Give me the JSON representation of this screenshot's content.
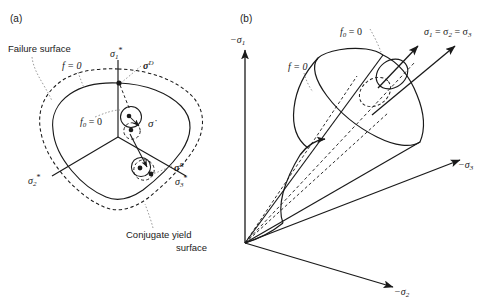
{
  "figure": {
    "background_color": "#ffffff",
    "line_color": "#1a1a1a"
  },
  "panel_a": {
    "tag": "(a)",
    "title_failure": "Failure surface",
    "title_conjugate_line1": "Conjugate yield",
    "title_conjugate_line2": "surface",
    "labels": {
      "f_zero": "f = 0",
      "f0_zero": "f",
      "f0_sub": "0",
      "f0_eq": " = 0",
      "sigma_dot": "σ̇",
      "sigma_D": "σ",
      "sigma_D_sup": "D",
      "sigma_R": "σ",
      "sigma_R_sup": "R",
      "axis1": "σ",
      "axis1_sub": "1",
      "axis1_star": "*",
      "axis2": "σ",
      "axis2_sub": "2",
      "axis2_star": "*",
      "axis3": "σ",
      "axis3_sub": "3",
      "axis3_star": "*"
    }
  },
  "panel_b": {
    "tag": "(b)",
    "labels": {
      "f_zero": "f = 0",
      "f0_zero": "f",
      "f0_sub": "0",
      "f0_eq": " = 0",
      "hydrostatic": "σ",
      "hydrostatic_sub1": "1",
      "hydrostatic_eq1": " = σ",
      "hydrostatic_sub2": "2",
      "hydrostatic_eq2": " = σ",
      "hydrostatic_sub3": "3",
      "axis1_neg": "−σ",
      "axis1_sub": "1",
      "axis2_neg": "−σ",
      "axis2_sub": "2",
      "axis3_neg": "−σ",
      "axis3_sub": "3"
    }
  }
}
